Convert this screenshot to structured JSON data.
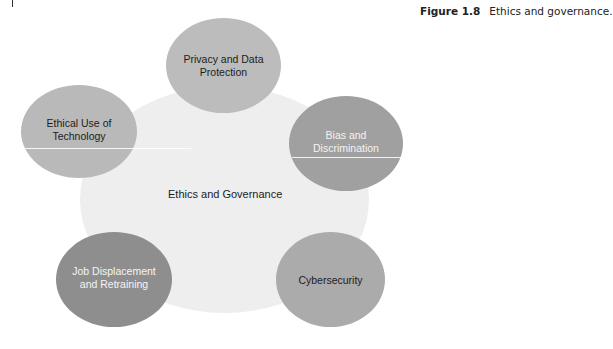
{
  "figure": {
    "number_label": "Figure 1.8",
    "caption": "Ethics and governance."
  },
  "diagram": {
    "type": "hub-and-spoke",
    "center": {
      "label": "Ethics and Governance",
      "color": "#eeeeee"
    },
    "nodes": [
      {
        "id": "privacy",
        "label_line1": "Privacy and Data",
        "label_line2": "Protection",
        "color": "#bcbcbc",
        "text_color": "#1c1c1c"
      },
      {
        "id": "ethical-use",
        "label_line1": "Ethical Use of",
        "label_line2": "Technology",
        "color": "#b9b9b9",
        "text_color": "#1c1c1c"
      },
      {
        "id": "bias",
        "label_line1": "Bias and",
        "label_line2": "Discrimination",
        "color": "#a0a0a0",
        "text_color": "#f3f3f3"
      },
      {
        "id": "job-displacement",
        "label_line1": "Job Displacement",
        "label_line2": "and Retraining",
        "color": "#8e8e8e",
        "text_color": "#f5f5f5"
      },
      {
        "id": "cybersecurity",
        "label_line1": "Cybersecurity",
        "label_line2": "",
        "color": "#ababab",
        "text_color": "#1c1c1c"
      }
    ]
  }
}
